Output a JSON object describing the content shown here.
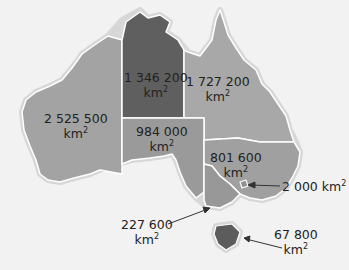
{
  "colors": {
    "background": "#f2f2f2",
    "coast_halo": "#d7d7d7",
    "border": "#ffffff",
    "wa": "#a3a3a3",
    "nt": "#5f5f5f",
    "qld": "#a8a8a8",
    "sa": "#9a9a9a",
    "nsw": "#a0a0a0",
    "vic": "#989898",
    "act": "#9a9a9a",
    "tas": "#5c5c5c",
    "text": "#222222",
    "arrow": "#333333"
  },
  "regions": [
    {
      "id": "wa",
      "value": "2 525 500",
      "unit": "km",
      "exp": "2"
    },
    {
      "id": "nt",
      "value": "1 346 200",
      "unit": "km",
      "exp": "2"
    },
    {
      "id": "qld",
      "value": "1 727 200",
      "unit": "km",
      "exp": "2"
    },
    {
      "id": "sa",
      "value": "984 000",
      "unit": "km",
      "exp": "2"
    },
    {
      "id": "nsw",
      "value": "801 600",
      "unit": "km",
      "exp": "2"
    },
    {
      "id": "act",
      "value": "2 000",
      "unit": "km",
      "exp": "2"
    },
    {
      "id": "vic",
      "value": "227 600",
      "unit": "km",
      "exp": "2"
    },
    {
      "id": "tas",
      "value": "67 800",
      "unit": "km",
      "exp": "2"
    }
  ]
}
